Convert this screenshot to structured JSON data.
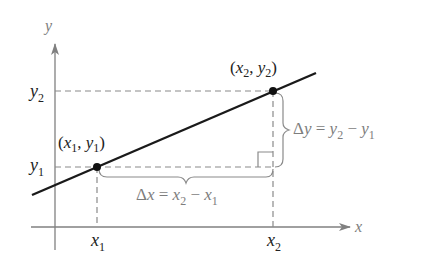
{
  "diagram": {
    "axes": {
      "x_label": "x",
      "y_label": "y"
    },
    "points": [
      {
        "id": "p1",
        "label_x": "x",
        "label_x_sub": "1",
        "label_y": "y",
        "label_y_sub": "1"
      },
      {
        "id": "p2",
        "label_x": "x",
        "label_x_sub": "2",
        "label_y": "y",
        "label_y_sub": "2"
      }
    ],
    "tick_labels": {
      "x1": {
        "base": "x",
        "sub": "1"
      },
      "x2": {
        "base": "x",
        "sub": "2"
      },
      "y1": {
        "base": "y",
        "sub": "1"
      },
      "y2": {
        "base": "y",
        "sub": "2"
      }
    },
    "annotations": {
      "delta_x": {
        "delta": "Δx",
        "eq": " = ",
        "a": "x",
        "a_sub": "2",
        "minus": " − ",
        "b": "x",
        "b_sub": "1"
      },
      "delta_y": {
        "delta": "Δy",
        "eq": " = ",
        "a": "y",
        "a_sub": "2",
        "minus": " − ",
        "b": "y",
        "b_sub": "1"
      }
    },
    "colors": {
      "line": "#1a1a1a",
      "axes": "#808080",
      "dashed": "#8a8a8a",
      "text_gray": "#7d7d7d",
      "text_dark": "#222222"
    }
  }
}
